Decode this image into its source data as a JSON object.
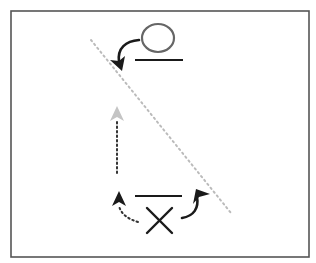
{
  "diagram": {
    "frame": {
      "x": 11,
      "y": 11,
      "width": 298,
      "height": 246,
      "stroke": "#555555"
    },
    "colors": {
      "ink": "#1a1a1a",
      "circle_stroke": "#666666",
      "diagonal_dotted": "#bbbbbb",
      "faded_arrow": "#c4c4c4",
      "vertical_dotted": "#333333"
    },
    "symbols": [
      {
        "id": "circle",
        "kind": "circle-mark",
        "cx": 158,
        "cy": 38,
        "rx": 16,
        "ry": 14
      },
      {
        "id": "top-line",
        "kind": "horizontal-bar",
        "x1": 135,
        "x2": 183,
        "y": 60
      },
      {
        "id": "bottom-line",
        "kind": "horizontal-bar",
        "x1": 135,
        "x2": 182,
        "y": 196
      },
      {
        "id": "cross",
        "kind": "x-mark",
        "x1": 147,
        "y1": 207,
        "x2": 172,
        "y2": 233
      }
    ],
    "arrows": [
      {
        "id": "top-curved-arrow",
        "style": "solid",
        "direction": "down-left"
      },
      {
        "id": "bottom-right-curved-arrow",
        "style": "solid",
        "direction": "up-right"
      },
      {
        "id": "bottom-left-dotted-arrow",
        "style": "dotted",
        "direction": "up"
      },
      {
        "id": "vertical-faded-arrow",
        "style": "dotted",
        "direction": "up"
      }
    ],
    "diagonal_line": {
      "x1": 91,
      "y1": 40,
      "x2": 231,
      "y2": 213,
      "style": "dotted"
    }
  }
}
